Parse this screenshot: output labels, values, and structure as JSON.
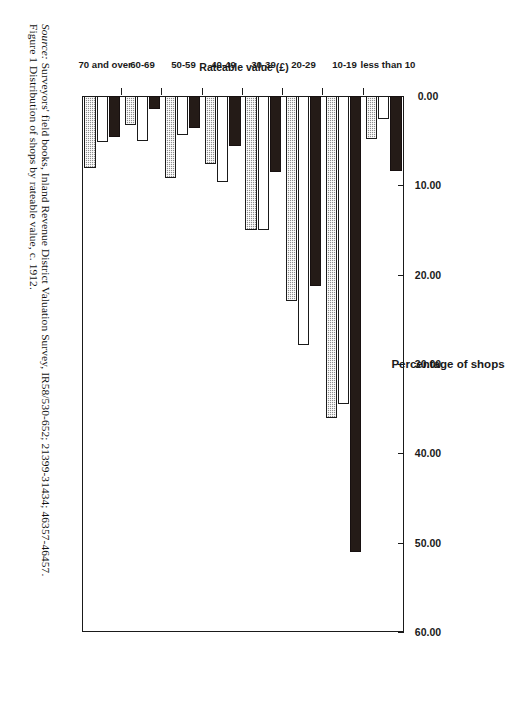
{
  "caption": {
    "figure_line": "Figure 1 Distribution of shops by rateable value, c. 1912.",
    "source_prefix": "Source:",
    "source_rest": " Surveyors' field books, Inland Revenue District Valuation Survey, IR58/530-652; 21399-31434; 46357-46457."
  },
  "chart_data": {
    "type": "bar",
    "orientation": "horizontal",
    "title": "",
    "xlabel": "Percentage of shops",
    "ylabel": "Rateable value (£)",
    "xlim": [
      0,
      60
    ],
    "xticks": [
      "0.00",
      "10.00",
      "20.00",
      "30.00",
      "40.00",
      "50.00",
      "60.00"
    ],
    "xtick_values": [
      0,
      10,
      20,
      30,
      40,
      50,
      60
    ],
    "grid": false,
    "legend_position": "bottom-center",
    "categories": [
      "less than 10",
      "10-19",
      "20-29",
      "30-39",
      "40-49",
      "50-59",
      "60-69",
      "70 and over"
    ],
    "series": [
      {
        "name": "Accrington",
        "color": "#241b17",
        "pattern": "solid-black",
        "values": [
          8.4,
          51.0,
          21.3,
          8.5,
          5.6,
          3.6,
          1.4,
          4.6
        ]
      },
      {
        "name": "Barrow",
        "color": "#ffffff",
        "pattern": "open-white",
        "values": [
          2.6,
          34.5,
          27.9,
          15.0,
          9.6,
          4.4,
          5.0,
          5.1
        ]
      },
      {
        "name": "Lancaster",
        "color": "#8e8e8e",
        "pattern": "checkered-grey",
        "values": [
          4.8,
          36.1,
          23.0,
          15.0,
          7.6,
          9.2,
          3.2,
          8.1
        ]
      }
    ]
  },
  "legend": {
    "entries": [
      {
        "label": "Accrington",
        "swatch": "accrington"
      },
      {
        "label": "Barrow",
        "swatch": "barrow"
      },
      {
        "label": "Lancaster",
        "swatch": "lancaster"
      }
    ]
  }
}
